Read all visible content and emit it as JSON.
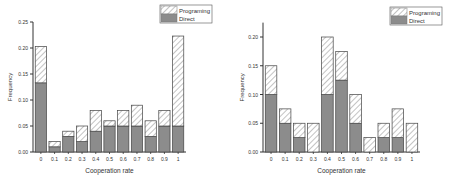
{
  "chart_data": [
    {
      "type": "bar",
      "stacked": true,
      "title": "",
      "xlabel": "Cooperation rate",
      "ylabel": "Frequency",
      "ylim": [
        0,
        0.25
      ],
      "yticks": [
        "0.00",
        "0.05",
        "0.10",
        "0.15",
        "0.20",
        "0.25"
      ],
      "categories": [
        "0",
        "0.1",
        "0.2",
        "0.3",
        "0.4",
        "0.5",
        "0.6",
        "0.7",
        "0.8",
        "0.9",
        "1"
      ],
      "series": [
        {
          "name": "Direct",
          "values": [
            0.133,
            0.01,
            0.03,
            0.02,
            0.04,
            0.05,
            0.05,
            0.05,
            0.03,
            0.05,
            0.05
          ]
        },
        {
          "name": "Programing",
          "values": [
            0.07,
            0.01,
            0.01,
            0.03,
            0.04,
            0.01,
            0.03,
            0.04,
            0.03,
            0.03,
            0.173
          ]
        }
      ],
      "totals": [
        0.203,
        0.02,
        0.04,
        0.05,
        0.08,
        0.06,
        0.08,
        0.09,
        0.06,
        0.08,
        0.223
      ],
      "legend": [
        "Programing",
        "Direct"
      ],
      "legend_position": "top-right",
      "grid": false
    },
    {
      "type": "bar",
      "stacked": true,
      "title": "",
      "xlabel": "Cooperation rate",
      "ylabel": "Frequency",
      "ylim": [
        0,
        0.225
      ],
      "yticks": [
        "0.00",
        "0.05",
        "0.10",
        "0.15",
        "0.20"
      ],
      "categories": [
        "0",
        "0.1",
        "0.2",
        "0.3",
        "0.4",
        "0.5",
        "0.6",
        "0.7",
        "0.8",
        "0.9",
        "1"
      ],
      "series": [
        {
          "name": "Direct",
          "values": [
            0.1,
            0.05,
            0.025,
            0.0,
            0.1,
            0.125,
            0.05,
            0.0,
            0.025,
            0.025,
            0.0
          ]
        },
        {
          "name": "Programing",
          "values": [
            0.05,
            0.025,
            0.025,
            0.05,
            0.1,
            0.05,
            0.05,
            0.025,
            0.025,
            0.05,
            0.05
          ]
        }
      ],
      "totals": [
        0.15,
        0.075,
        0.05,
        0.05,
        0.2,
        0.175,
        0.1,
        0.025,
        0.05,
        0.075,
        0.05
      ],
      "legend": [
        "Programing",
        "Direct"
      ],
      "legend_position": "top-right",
      "grid": false
    }
  ],
  "colors": {
    "direct_fill": "#8c8c8c",
    "programing_fill": "#ffffff",
    "hatch": "#9a9a9a",
    "stroke": "#444444"
  }
}
